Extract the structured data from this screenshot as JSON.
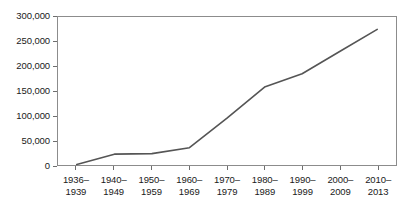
{
  "chart_data": {
    "type": "line",
    "title": "",
    "subtitle": "",
    "xlabel": "",
    "ylabel": "",
    "categories": [
      "1936–1939",
      "1940–1949",
      "1950–1959",
      "1960–1969",
      "1970–1979",
      "1980–1989",
      "1990–1999",
      "2000–2009",
      "2010–2013"
    ],
    "category_lines": [
      [
        "1936–",
        "1939"
      ],
      [
        "1940–",
        "1949"
      ],
      [
        "1950–",
        "1959"
      ],
      [
        "1960–",
        "1969"
      ],
      [
        "1970–",
        "1979"
      ],
      [
        "1980–",
        "1989"
      ],
      [
        "1990–",
        "1999"
      ],
      [
        "2000–",
        "2009"
      ],
      [
        "2010–",
        "2013"
      ]
    ],
    "values": [
      1000,
      22000,
      23000,
      35000,
      95000,
      158000,
      185000,
      230000,
      275000
    ],
    "series": [
      {
        "name": "series-1",
        "values": [
          1000,
          22000,
          23000,
          35000,
          95000,
          158000,
          185000,
          230000,
          275000
        ]
      }
    ],
    "ylim": [
      0,
      300000
    ],
    "ytick_values": [
      0,
      50000,
      100000,
      150000,
      200000,
      250000,
      300000
    ],
    "ytick_labels": [
      "0",
      "50,000",
      "100,000",
      "150,000",
      "200,000",
      "250,000",
      "300,000"
    ],
    "grid": false,
    "legend": false,
    "legend_position": "none",
    "markers": false,
    "line_color": "#555555",
    "frame_color": "#8c8c8c",
    "background_color": "#ffffff",
    "text_color": "#1a1a1a"
  }
}
